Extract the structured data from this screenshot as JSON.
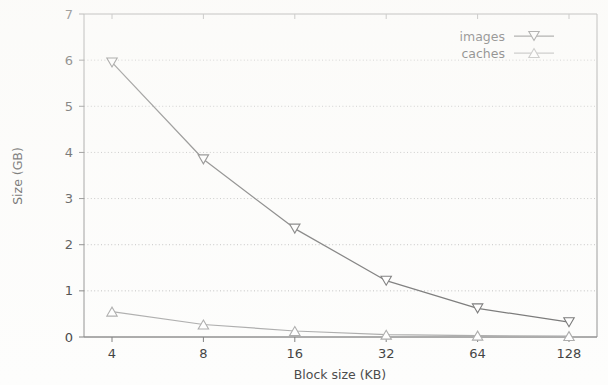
{
  "chart_data": {
    "type": "line",
    "title": "",
    "xlabel": "Block size (KB)",
    "ylabel": "Size (GB)",
    "categories": [
      "4",
      "8",
      "16",
      "32",
      "64",
      "128"
    ],
    "ylim": [
      0,
      7
    ],
    "yticks": [
      "0",
      "1",
      "2",
      "3",
      "4",
      "5",
      "6",
      "7"
    ],
    "grid": "horizontal-dotted",
    "legend_position": "top-right",
    "series": [
      {
        "name": "images",
        "marker": "triangle-down",
        "color": "#6e6e6e",
        "values": [
          5.95,
          3.85,
          2.35,
          1.22,
          0.62,
          0.32
        ]
      },
      {
        "name": "caches",
        "marker": "triangle-up",
        "color": "#a8a8a8",
        "values": [
          0.55,
          0.27,
          0.13,
          0.05,
          0.03,
          0.02
        ]
      }
    ]
  },
  "axes": {
    "y_title": "Size (GB)",
    "x_title": "Block size (KB)",
    "y_ticks": [
      "7",
      "6",
      "5",
      "4",
      "3",
      "2",
      "1",
      "0"
    ],
    "x_ticks": [
      "4",
      "8",
      "16",
      "32",
      "64",
      "128"
    ]
  },
  "legend": {
    "entries": [
      {
        "label": "images"
      },
      {
        "label": "caches"
      }
    ]
  }
}
